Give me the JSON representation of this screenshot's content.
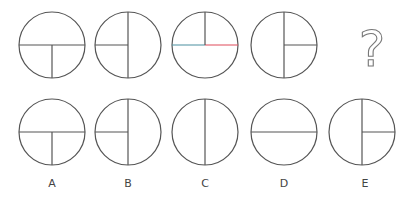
{
  "puzzle": {
    "stroke_color": "#555555",
    "accent_colors": {
      "left_segment": "#4a8fa0",
      "right_segment": "#e04a5a"
    },
    "question_mark": "?",
    "sequence": [
      {
        "id": "s1",
        "cx": 52,
        "cy": 45,
        "r": 33,
        "lines": [
          "h-full",
          "v-bottom"
        ]
      },
      {
        "id": "s2",
        "cx": 128,
        "cy": 45,
        "r": 33,
        "lines": [
          "v-full",
          "h-left"
        ]
      },
      {
        "id": "s3",
        "cx": 205,
        "cy": 45,
        "r": 33,
        "lines": [
          "h-full-colored",
          "v-top"
        ]
      },
      {
        "id": "s4",
        "cx": 284,
        "cy": 45,
        "r": 33,
        "lines": [
          "v-full",
          "h-right"
        ]
      }
    ],
    "options": [
      {
        "label": "A",
        "cx": 52,
        "cy": 132,
        "r": 33,
        "lines": [
          "h-full",
          "v-bottom"
        ]
      },
      {
        "label": "B",
        "cx": 128,
        "cy": 132,
        "r": 33,
        "lines": [
          "v-full",
          "h-left"
        ]
      },
      {
        "label": "C",
        "cx": 205,
        "cy": 132,
        "r": 33,
        "lines": [
          "v-full"
        ]
      },
      {
        "label": "D",
        "cx": 284,
        "cy": 132,
        "r": 33,
        "lines": [
          "h-full"
        ]
      },
      {
        "label": "E",
        "cx": 362,
        "cy": 132,
        "r": 33,
        "lines": [
          "v-full",
          "h-right"
        ]
      }
    ]
  },
  "labels": {
    "a": "A",
    "b": "B",
    "c": "C",
    "d": "D",
    "e": "E"
  }
}
